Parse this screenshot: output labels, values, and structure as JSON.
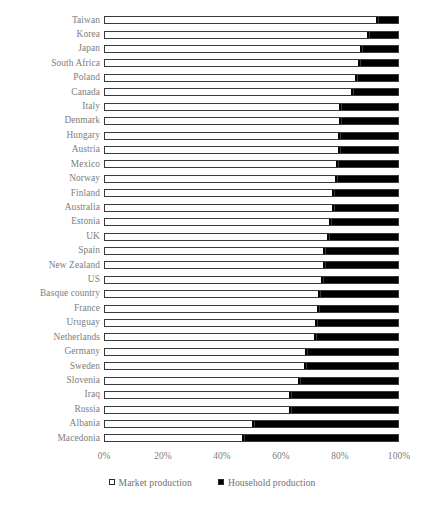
{
  "chart_data": {
    "type": "bar",
    "orientation": "horizontal",
    "stacked": true,
    "title": "",
    "subtitle": "",
    "xlabel": "",
    "ylabel": "",
    "xlim": [
      0,
      100
    ],
    "x_ticks": [
      "0%",
      "20%",
      "40%",
      "60%",
      "80%",
      "100%"
    ],
    "x_tick_values": [
      0,
      20,
      40,
      60,
      80,
      100
    ],
    "grid": false,
    "legend_position": "bottom",
    "categories": [
      "Taiwan",
      "Korea",
      "Japan",
      "South Africa",
      "Poland",
      "Canada",
      "Italy",
      "Denmark",
      "Hungary",
      "Austria",
      "Mexico",
      "Norway",
      "Finland",
      "Australia",
      "Estonia",
      "UK",
      "Spain",
      "New Zealand",
      "US",
      "Basque country",
      "France",
      "Uruguay",
      "Netherlands",
      "Germany",
      "Sweden",
      "Slovenia",
      "Iraq",
      "Russia",
      "Albania",
      "Macedonia"
    ],
    "series": [
      {
        "name": "Market production",
        "color": "#ffffff",
        "values": [
          92.5,
          89.5,
          87.0,
          86.5,
          85.5,
          84.0,
          80.0,
          80.0,
          79.5,
          79.5,
          79.0,
          78.5,
          77.5,
          77.5,
          76.5,
          76.0,
          74.5,
          74.5,
          74.0,
          73.0,
          72.5,
          72.0,
          71.5,
          68.5,
          68.0,
          66.0,
          63.0,
          63.0,
          50.5,
          47.0
        ]
      },
      {
        "name": "Household production",
        "color": "#000000",
        "values": [
          7.5,
          10.5,
          13.0,
          13.5,
          14.5,
          16.0,
          20.0,
          20.0,
          20.5,
          20.5,
          21.0,
          21.5,
          22.5,
          22.5,
          23.5,
          24.0,
          25.5,
          25.5,
          26.0,
          27.0,
          27.5,
          28.0,
          28.5,
          31.5,
          32.0,
          34.0,
          37.0,
          37.0,
          49.5,
          53.0
        ]
      }
    ],
    "legend": [
      {
        "label": "Market production",
        "swatch": "open-square"
      },
      {
        "label": "Household production",
        "swatch": "filled-square"
      }
    ]
  },
  "colors": {
    "label_text": "#7d7d7d",
    "bar_outline": "#3a3a3a",
    "market": "#ffffff",
    "household": "#000000",
    "background": "#ffffff"
  }
}
